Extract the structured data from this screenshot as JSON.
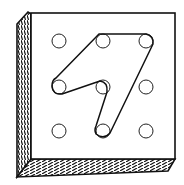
{
  "diagram": {
    "grid": {
      "rows": 3,
      "cols": 3
    },
    "peg_columns_x": [
      59,
      103,
      146
    ],
    "peg_rows_y": [
      41,
      87,
      131
    ],
    "band_path_pegs": [
      [
        0,
        1
      ],
      [
        0,
        2
      ],
      [
        2,
        1
      ],
      [
        1,
        0
      ],
      [
        1,
        1
      ]
    ],
    "colors": {
      "ink": "#111111",
      "background": "#ffffff"
    }
  }
}
